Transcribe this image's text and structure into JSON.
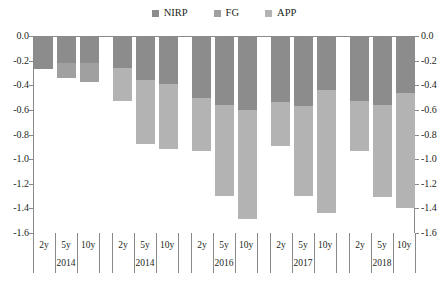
{
  "chart_data": {
    "type": "bar",
    "stacked": true,
    "orientation": "vertical",
    "title": "",
    "subtitle": "",
    "xlabel": "",
    "ylabel": "",
    "ylim": [
      -1.6,
      0.0
    ],
    "ytick_labels": [
      "0.0",
      "-0.2",
      "-0.4",
      "-0.6",
      "-0.8",
      "-1.0",
      "-1.2",
      "-1.4",
      "-1.6"
    ],
    "ytick_values": [
      0.0,
      -0.2,
      -0.4,
      -0.6,
      -0.8,
      -1.0,
      -1.2,
      -1.4,
      -1.6
    ],
    "dual_y_axis": true,
    "grid": false,
    "legend_position": "top-center",
    "legend": [
      "NIRP",
      "FG",
      "APP"
    ],
    "colors": {
      "NIRP": "#8c8c8c",
      "FG": "#a0a0a0",
      "APP": "#b3b3b3"
    },
    "groups": [
      "2014",
      "2014",
      "2016",
      "2017",
      "2018"
    ],
    "maturities": [
      "2y",
      "5y",
      "10y"
    ],
    "categories": [
      "2014 2y",
      "2014 5y",
      "2014 10y",
      "2014 2y",
      "2014 5y",
      "2014 10y",
      "2016 2y",
      "2016 5y",
      "2016 10y",
      "2017 2y",
      "2017 5y",
      "2017 10y",
      "2018 2y",
      "2018 5y",
      "2018 10y"
    ],
    "series": [
      {
        "name": "NIRP",
        "values": [
          -0.27,
          -0.22,
          -0.22,
          -0.26,
          -0.36,
          -0.39,
          -0.5,
          -0.56,
          -0.6,
          -0.54,
          -0.57,
          -0.44,
          -0.53,
          -0.56,
          -0.46
        ]
      },
      {
        "name": "FG",
        "values": [
          0.0,
          -0.12,
          -0.15,
          0.0,
          0.0,
          0.0,
          0.0,
          0.0,
          0.0,
          0.0,
          0.0,
          0.0,
          0.0,
          0.0,
          0.0
        ]
      },
      {
        "name": "APP",
        "values": [
          0.0,
          0.0,
          0.0,
          -0.27,
          -0.52,
          -0.53,
          -0.43,
          -0.74,
          -0.89,
          -0.35,
          -0.73,
          -1.0,
          -0.4,
          -0.75,
          -0.94
        ]
      }
    ],
    "totals": [
      -0.27,
      -0.34,
      -0.37,
      -0.53,
      -0.88,
      -0.92,
      -0.93,
      -1.3,
      -1.49,
      -0.89,
      -1.3,
      -1.44,
      -0.93,
      -1.31,
      -1.4
    ]
  },
  "legend": {
    "items": [
      {
        "label": "NIRP",
        "color": "#8c8c8c"
      },
      {
        "label": "FG",
        "color": "#a0a0a0"
      },
      {
        "label": "APP",
        "color": "#b3b3b3"
      }
    ]
  },
  "axes": {
    "left_labels": [
      "0.0",
      "-0.2",
      "-0.4",
      "-0.6",
      "-0.8",
      "-1.0",
      "-1.2",
      "-1.4",
      "-1.6"
    ],
    "right_labels": [
      "0.0",
      "-0.2",
      "-0.4",
      "-0.6",
      "-0.8",
      "-1.0",
      "-1.2",
      "-1.4",
      "-1.6"
    ]
  },
  "xaxis": {
    "groups": [
      {
        "year": "2014",
        "maturities": [
          "2y",
          "5y",
          "10y"
        ]
      },
      {
        "year": "2014",
        "maturities": [
          "2y",
          "5y",
          "10y"
        ]
      },
      {
        "year": "2016",
        "maturities": [
          "2y",
          "5y",
          "10y"
        ]
      },
      {
        "year": "2017",
        "maturities": [
          "2y",
          "5y",
          "10y"
        ]
      },
      {
        "year": "2018",
        "maturities": [
          "2y",
          "5y",
          "10y"
        ]
      }
    ]
  }
}
